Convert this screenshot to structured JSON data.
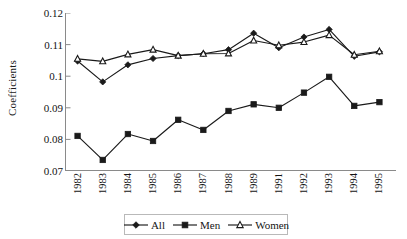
{
  "chart_data": {
    "type": "line",
    "title": "",
    "xlabel": "",
    "ylabel": "Coefficients",
    "categories": [
      "1982",
      "1983",
      "1984",
      "1985",
      "1986",
      "1987",
      "1988",
      "1989",
      "1991",
      "1992",
      "1993",
      "1994",
      "1995"
    ],
    "ylim": [
      0.07,
      0.12
    ],
    "yticks": [
      0.07,
      0.08,
      0.09,
      0.1,
      0.11,
      0.12
    ],
    "ytick_labels": [
      "0.07",
      "0.08",
      "0.09",
      "0.1",
      "0.11",
      "0.12"
    ],
    "grid": false,
    "legend_position": "bottom",
    "series": [
      {
        "name": "All",
        "marker": "diamond",
        "color": "#1a1a1a",
        "values": [
          0.1048,
          0.0982,
          0.1036,
          0.1056,
          0.1065,
          0.1071,
          0.1084,
          0.1136,
          0.109,
          0.1124,
          0.1148,
          0.1063,
          0.1077
        ]
      },
      {
        "name": "Men",
        "marker": "square",
        "color": "#1a1a1a",
        "values": [
          0.0811,
          0.0735,
          0.0817,
          0.0795,
          0.0862,
          0.083,
          0.089,
          0.0911,
          0.09,
          0.0948,
          0.0998,
          0.0906,
          0.0918
        ]
      },
      {
        "name": "Women",
        "marker": "triangle",
        "color": "#1a1a1a",
        "values": [
          0.1055,
          0.1047,
          0.1069,
          0.1084,
          0.1065,
          0.1071,
          0.1072,
          0.1113,
          0.1098,
          0.1108,
          0.113,
          0.1068,
          0.1079
        ]
      }
    ]
  },
  "axis": {
    "line_color": "#8a8a8a",
    "tick_color": "#8a8a8a"
  },
  "legend": {
    "entries": [
      {
        "label": "All",
        "marker": "diamond"
      },
      {
        "label": "Men",
        "marker": "square"
      },
      {
        "label": "Women",
        "marker": "triangle"
      }
    ]
  }
}
